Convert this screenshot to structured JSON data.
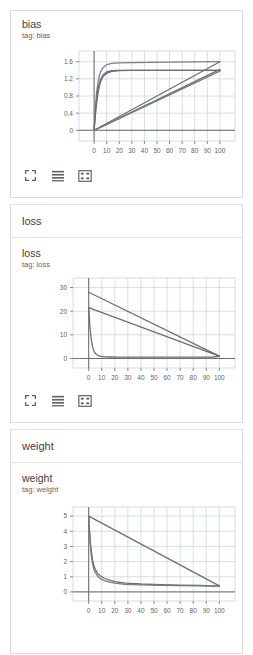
{
  "panels": [
    {
      "section_header": null,
      "title": "bias",
      "subtitle": "tag: bias",
      "show_toolbar": true,
      "toolbar": {
        "expand_label": "expand-chart",
        "data_label": "data-series",
        "fit_label": "fit-domain"
      },
      "chart_data": {
        "type": "line",
        "title": "bias",
        "xlabel": "",
        "ylabel": "",
        "xlim": [
          -12,
          112
        ],
        "ylim": [
          -0.25,
          1.85
        ],
        "xticks": [
          0,
          10,
          20,
          30,
          40,
          50,
          60,
          70,
          80,
          90,
          100
        ],
        "yticks": [
          0,
          0.4,
          0.8,
          1.2,
          1.6
        ],
        "grid": true,
        "legend": "none",
        "series": [
          {
            "name": "saturating-high",
            "color": "#808080",
            "x": [
              0,
              1,
              2,
              3,
              4,
              5,
              7,
              10,
              14,
              20,
              30,
              45,
              60,
              80,
              100
            ],
            "y": [
              0.0,
              0.55,
              0.88,
              1.1,
              1.25,
              1.35,
              1.46,
              1.53,
              1.56,
              1.575,
              1.58,
              1.585,
              1.59,
              1.595,
              1.6
            ]
          },
          {
            "name": "saturating-mid-a",
            "color": "#6e6e6e",
            "x": [
              0,
              1,
              2,
              3,
              4,
              5,
              7,
              10,
              14,
              20,
              30,
              45,
              60,
              80,
              100
            ],
            "y": [
              0.0,
              0.42,
              0.72,
              0.94,
              1.08,
              1.18,
              1.29,
              1.36,
              1.39,
              1.4,
              1.4,
              1.4,
              1.4,
              1.4,
              1.4
            ]
          },
          {
            "name": "saturating-mid-b",
            "color": "#6e6e6e",
            "x": [
              0,
              1,
              2,
              3,
              4,
              5,
              7,
              10,
              14,
              20,
              30,
              45,
              60,
              80,
              100
            ],
            "y": [
              0.0,
              0.35,
              0.63,
              0.85,
              1.0,
              1.12,
              1.25,
              1.33,
              1.375,
              1.392,
              1.396,
              1.398,
              1.398,
              1.398,
              1.398
            ]
          },
          {
            "name": "linear-ramp-high",
            "color": "#6e6e6e",
            "x": [
              0,
              100
            ],
            "y": [
              0.0,
              1.6
            ]
          },
          {
            "name": "linear-ramp-mid",
            "color": "#6e6e6e",
            "x": [
              0,
              100
            ],
            "y": [
              0.0,
              1.42
            ]
          },
          {
            "name": "linear-ramp-low",
            "color": "#7a7a7a",
            "x": [
              0,
              100
            ],
            "y": [
              0.0,
              1.38
            ]
          }
        ]
      }
    },
    {
      "section_header": "loss",
      "title": "loss",
      "subtitle": "tag: loss",
      "show_toolbar": true,
      "toolbar": {
        "expand_label": "expand-chart",
        "data_label": "data-series",
        "fit_label": "fit-domain"
      },
      "chart_data": {
        "type": "line",
        "title": "loss",
        "xlabel": "",
        "ylabel": "",
        "xlim": [
          -12,
          112
        ],
        "ylim": [
          -4,
          34
        ],
        "xticks": [
          0,
          10,
          20,
          30,
          40,
          50,
          60,
          70,
          80,
          90,
          100
        ],
        "yticks": [
          0,
          10,
          20,
          30
        ],
        "grid": true,
        "legend": "none",
        "series": [
          {
            "name": "exp-decay",
            "color": "#6e6e6e",
            "x": [
              0,
              1,
              2,
              3,
              4,
              5,
              6,
              8,
              10,
              13,
              17,
              22,
              30,
              45,
              60,
              80,
              95,
              100
            ],
            "y": [
              21.5,
              13.0,
              8.0,
              5.0,
              3.2,
              2.2,
              1.7,
              1.1,
              0.85,
              0.7,
              0.65,
              0.62,
              0.6,
              0.6,
              0.6,
              0.6,
              0.65,
              0.9
            ]
          },
          {
            "name": "linear-decay-high",
            "color": "#6e6e6e",
            "x": [
              0,
              100
            ],
            "y": [
              28.0,
              1.0
            ]
          },
          {
            "name": "linear-decay-mid",
            "color": "#6e6e6e",
            "x": [
              0,
              100
            ],
            "y": [
              21.5,
              1.0
            ]
          }
        ]
      }
    },
    {
      "section_header": "weight",
      "title": "weight",
      "subtitle": "tag: weight",
      "show_toolbar": false,
      "toolbar": {
        "expand_label": "expand-chart",
        "data_label": "data-series",
        "fit_label": "fit-domain"
      },
      "chart_data": {
        "type": "line",
        "title": "weight",
        "xlabel": "",
        "ylabel": "",
        "xlim": [
          -12,
          112
        ],
        "ylim": [
          -0.6,
          5.6
        ],
        "xticks": [
          0,
          10,
          20,
          30,
          40,
          50,
          60,
          70,
          80,
          90,
          100
        ],
        "yticks": [
          0,
          1,
          2,
          3,
          4,
          5
        ],
        "grid": true,
        "legend": "none",
        "series": [
          {
            "name": "exp-decay-a",
            "color": "#6e6e6e",
            "x": [
              0,
              1,
              2,
              3,
              4,
              5,
              7,
              9,
              12,
              16,
              20,
              28,
              40,
              55,
              70,
              85,
              95,
              100
            ],
            "y": [
              5.0,
              3.6,
              2.7,
              2.1,
              1.75,
              1.5,
              1.2,
              1.05,
              0.9,
              0.78,
              0.68,
              0.58,
              0.52,
              0.48,
              0.45,
              0.43,
              0.4,
              0.38
            ]
          },
          {
            "name": "exp-decay-b",
            "color": "#7a7a7a",
            "x": [
              0,
              1,
              2,
              3,
              4,
              5,
              7,
              9,
              12,
              16,
              20,
              28,
              40,
              55,
              70,
              85,
              95,
              100
            ],
            "y": [
              5.0,
              3.3,
              2.4,
              1.85,
              1.5,
              1.28,
              1.02,
              0.88,
              0.75,
              0.65,
              0.58,
              0.5,
              0.46,
              0.43,
              0.41,
              0.4,
              0.38,
              0.36
            ]
          },
          {
            "name": "linear-decay",
            "color": "#6e6e6e",
            "x": [
              0,
              100
            ],
            "y": [
              5.0,
              0.4
            ]
          }
        ]
      }
    }
  ],
  "theme": {
    "grid_color": "#c9d5e8",
    "axis_color": "#6b6b6b",
    "line_color": "#6e6e6e",
    "tick_text_color": "#5f6368",
    "card_border": "#dcdcdc"
  }
}
